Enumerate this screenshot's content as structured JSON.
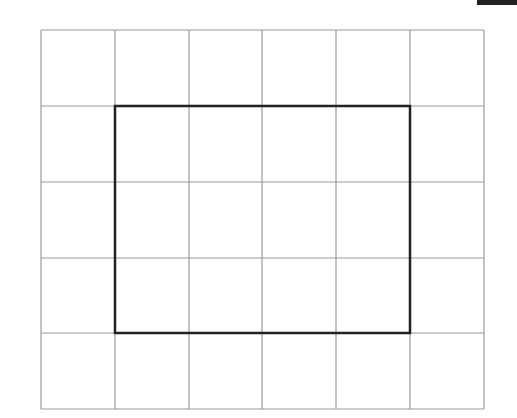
{
  "diagram": {
    "type": "grid-with-highlighted-rectangle",
    "grid": {
      "columns": 6,
      "rows": 5,
      "x_lines": [
        41,
        115,
        189,
        262,
        336,
        410,
        484
      ],
      "y_lines": [
        30,
        106,
        182,
        258,
        333,
        409
      ],
      "line_color": "#9a9a9a"
    },
    "highlight_rectangle": {
      "from_col": 1,
      "to_col": 5,
      "from_row": 1,
      "to_row": 4,
      "width_units": 4,
      "height_units": 3,
      "stroke_color": "#222222"
    },
    "corner_bar_color": "#222222"
  }
}
